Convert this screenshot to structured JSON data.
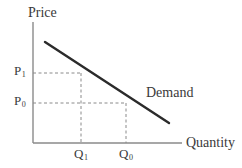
{
  "figure": {
    "type": "economics-supply-demand-diagram",
    "title": "",
    "axes": {
      "y_axis_label": "Price",
      "x_axis_label": "Quantity",
      "origin": {
        "x": 33,
        "y": 143
      },
      "y_axis_top": 22,
      "x_axis_right": 182
    },
    "curve": {
      "label": "Demand",
      "start": {
        "x": 45,
        "y": 42
      },
      "end": {
        "x": 169,
        "y": 123
      }
    },
    "price_ticks": [
      {
        "name": "P1",
        "text": "P",
        "sub": "1",
        "y": 73
      },
      {
        "name": "P0",
        "text": "P",
        "sub": "0",
        "y": 103
      }
    ],
    "quantity_ticks": [
      {
        "name": "Q1",
        "text": "Q",
        "sub": "1",
        "x": 81
      },
      {
        "name": "Q0",
        "text": "Q",
        "sub": "0",
        "x": 126
      }
    ],
    "guide_lines": [
      {
        "name": "p1-horizontal",
        "from": [
          33,
          73
        ],
        "to": [
          81,
          73
        ]
      },
      {
        "name": "q1-vertical",
        "from": [
          81,
          73
        ],
        "to": [
          81,
          143
        ]
      },
      {
        "name": "p0-horizontal",
        "from": [
          33,
          103
        ],
        "to": [
          126,
          103
        ]
      },
      {
        "name": "q0-vertical",
        "from": [
          126,
          103
        ],
        "to": [
          126,
          143
        ]
      }
    ],
    "colors": {
      "background": "#ffffff",
      "axis": "#8a8a8a",
      "curve": "#2b2b2b",
      "dashed": "#8a8a8a",
      "text": "#3a3a3a"
    }
  }
}
